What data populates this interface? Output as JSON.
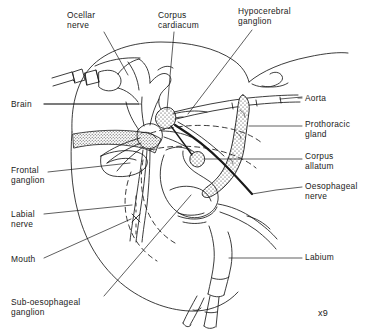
{
  "figure": {
    "kind": "anatomical-line-drawing",
    "scale_note": "x9",
    "ink_color": "#1a1a1a",
    "background_color": "#ffffff",
    "stipple_color": "#2a2a2a"
  },
  "labels": {
    "ocellar_nerve": "Ocellar\nnerve",
    "corpus_cardiacum": "Corpus\ncardiacum",
    "hypocerebral_ganglion": "Hypocerebral\nganglion",
    "brain": "Brain",
    "frontal_ganglion": "Frontal\nganglion",
    "labial_nerve": "Labial\nnerve",
    "mouth": "Mouth",
    "sub_oesophageal_ganglion": "Sub-oesophageal\nganglion",
    "aorta": "Aorta",
    "prothoracic_gland": "Prothoracic\ngland",
    "corpus_allatum": "Corpus\nallatum",
    "oesophageal_nerve": "Oesophageal\nnerve",
    "labium": "Labium"
  },
  "label_list": [
    {
      "key": "ocellar_nerve",
      "text": "Ocellar nerve",
      "side": "top-left",
      "x": 67,
      "y": 11
    },
    {
      "key": "corpus_cardiacum",
      "text": "Corpus cardiacum",
      "side": "top-center",
      "x": 158,
      "y": 11
    },
    {
      "key": "hypocerebral_ganglion",
      "text": "Hypocerebral ganglion",
      "side": "top-right",
      "x": 238,
      "y": 7
    },
    {
      "key": "brain",
      "text": "Brain",
      "side": "left",
      "x": 11,
      "y": 100
    },
    {
      "key": "frontal_ganglion",
      "text": "Frontal ganglion",
      "side": "left",
      "x": 11,
      "y": 166
    },
    {
      "key": "labial_nerve",
      "text": "Labial nerve",
      "side": "left",
      "x": 11,
      "y": 210
    },
    {
      "key": "mouth",
      "text": "Mouth",
      "side": "left",
      "x": 11,
      "y": 255
    },
    {
      "key": "sub_oesophageal_ganglion",
      "text": "Sub-oesophageal ganglion",
      "side": "bottom-left",
      "x": 11,
      "y": 298
    },
    {
      "key": "aorta",
      "text": "Aorta",
      "side": "right",
      "x": 305,
      "y": 94
    },
    {
      "key": "prothoracic_gland",
      "text": "Prothoracic gland",
      "side": "right",
      "x": 305,
      "y": 120
    },
    {
      "key": "corpus_allatum",
      "text": "Corpus allatum",
      "side": "right",
      "x": 305,
      "y": 152
    },
    {
      "key": "oesophageal_nerve",
      "text": "Oesophageal nerve",
      "side": "right",
      "x": 305,
      "y": 182
    },
    {
      "key": "labium",
      "text": "Labium",
      "side": "right",
      "x": 305,
      "y": 253
    }
  ],
  "structures": [
    {
      "name": "head-capsule-outline",
      "style": "solid"
    },
    {
      "name": "antenna-base-segments",
      "style": "solid"
    },
    {
      "name": "neck-membrane",
      "style": "solid"
    },
    {
      "name": "brain-mass",
      "style": "solid"
    },
    {
      "name": "corpus-cardiacum-body",
      "style": "stippled"
    },
    {
      "name": "corpus-allatum-body",
      "style": "stippled"
    },
    {
      "name": "prothoracic-gland-band",
      "style": "stippled"
    },
    {
      "name": "compound-eye-band",
      "style": "stippled"
    },
    {
      "name": "aorta-tube",
      "style": "solid"
    },
    {
      "name": "oesophagus-outline",
      "style": "dashed"
    },
    {
      "name": "sub-oesophageal-ganglion",
      "style": "solid"
    },
    {
      "name": "labium-outline",
      "style": "solid"
    },
    {
      "name": "labial-palps",
      "style": "solid"
    },
    {
      "name": "mouth-marker",
      "style": "cross"
    }
  ]
}
